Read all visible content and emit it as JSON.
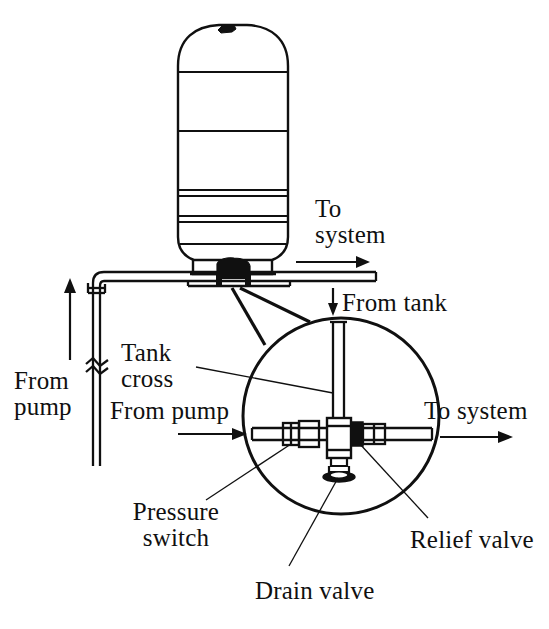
{
  "figure": {
    "type": "technical-line-diagram",
    "background_color": "#ffffff",
    "line_color": "#101010"
  },
  "labels": {
    "to_system_top": {
      "line1": "To",
      "line2": "system",
      "arrow": "right-arrow"
    },
    "from_tank": {
      "text": "From tank",
      "arrow": "down-arrow"
    },
    "tank_cross": {
      "line1": "Tank",
      "line2": "cross"
    },
    "from_pump_left": {
      "line1": "From",
      "line2": "pump",
      "arrow": "up-arrow"
    },
    "from_pump_detail": {
      "text": "From pump",
      "arrow": "right-arrow"
    },
    "to_system_detail": {
      "text": "To system",
      "arrow": "right-arrow"
    },
    "pressure_switch": {
      "line1": "Pressure",
      "line2": "switch"
    },
    "relief_valve": {
      "text": "Relief valve"
    },
    "drain_valve": {
      "text": "Drain valve"
    }
  },
  "components": [
    {
      "name": "pressure-tank",
      "label": ""
    },
    {
      "name": "tank-cross-fitting",
      "label": "Tank cross"
    },
    {
      "name": "pressure-switch",
      "label": "Pressure switch"
    },
    {
      "name": "relief-valve",
      "label": "Relief valve"
    },
    {
      "name": "drain-valve",
      "label": "Drain valve"
    },
    {
      "name": "detail-callout-circle",
      "label": ""
    }
  ]
}
